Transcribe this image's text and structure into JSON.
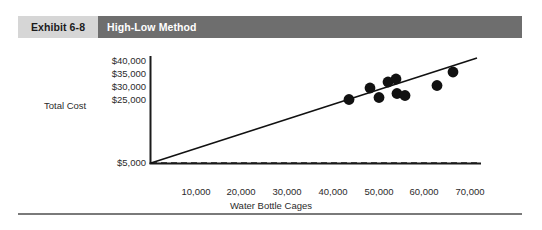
{
  "header": {
    "exhibit_tag": "Exhibit 6-8",
    "title": "High-Low Method",
    "tag_bg": "#d6d6d6",
    "title_bg": "#6e6e6e",
    "title_color": "#ffffff"
  },
  "rule": {
    "color": "#7a7a7a"
  },
  "chart_data": {
    "type": "scatter",
    "title": "High-Low Method",
    "xlabel": "Water Bottle Cages",
    "ylabel": "Total Cost",
    "xlim": [
      0,
      75000
    ],
    "ylim": [
      0,
      42500
    ],
    "grid": false,
    "legend": null,
    "xticks": [
      "10,000",
      "20,000",
      "30,000",
      "40,000",
      "50,000",
      "60,000",
      "70,000"
    ],
    "xtick_values": [
      10000,
      20000,
      30000,
      40000,
      50000,
      60000,
      70000
    ],
    "yticks": [
      "$40,000",
      "$35,000",
      "$30,000",
      "$25,000",
      "$5,000"
    ],
    "ytick_values": [
      40000,
      35000,
      30000,
      25000,
      5000
    ],
    "points": [
      {
        "x": 44000,
        "y": 28500
      },
      {
        "x": 48500,
        "y": 31500
      },
      {
        "x": 50500,
        "y": 29000
      },
      {
        "x": 52500,
        "y": 33000
      },
      {
        "x": 54000,
        "y": 34000
      },
      {
        "x": 54200,
        "y": 30000
      },
      {
        "x": 56000,
        "y": 29500
      },
      {
        "x": 63000,
        "y": 32000
      },
      {
        "x": 66500,
        "y": 35500
      }
    ],
    "marker_color": "#111111",
    "marker_size_px": 5.4,
    "trend_line": {
      "label": "cost-line",
      "x_start": 0,
      "y_start": 5000,
      "x_end": 71000,
      "y_end": 37500,
      "color": "#111111",
      "width_px": 1.6
    },
    "fixed_cost_line": {
      "label": "fixed-cost-line",
      "y": 5000,
      "x_start": 0,
      "x_end": 71500,
      "style": "dashed",
      "color": "#1b1b1b"
    },
    "axis_color": "#1b1b1b"
  }
}
